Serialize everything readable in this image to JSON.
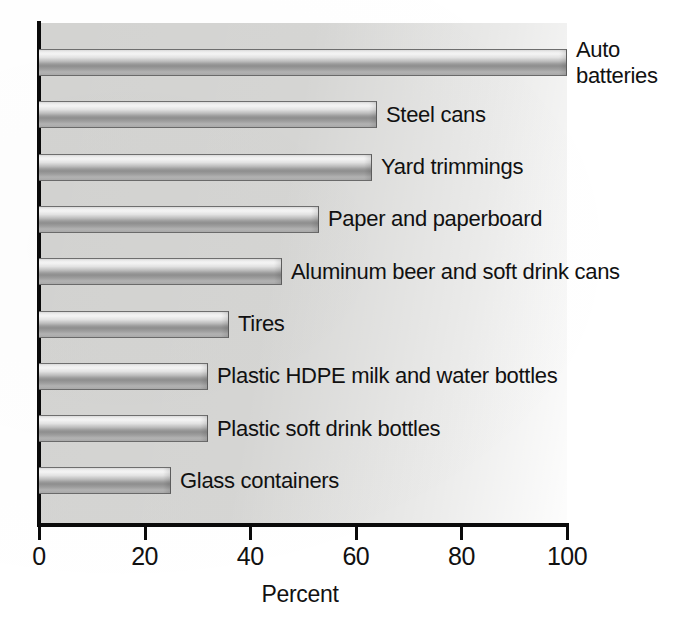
{
  "chart_data": {
    "type": "bar",
    "orientation": "horizontal",
    "title": "",
    "subtitle": "",
    "xlabel": "Percent",
    "ylabel": "",
    "xlim": [
      0,
      100
    ],
    "ylim": null,
    "grid": false,
    "legend": null,
    "xticks": [
      0,
      20,
      40,
      60,
      80,
      100
    ],
    "xticklabels": [
      "0",
      "20",
      "40",
      "60",
      "80",
      "100"
    ],
    "categories": [
      "Auto\nbatteries",
      "Steel cans",
      "Yard trimmings",
      "Paper and paperboard",
      "Aluminum beer and soft drink cans",
      "Tires",
      "Plastic HDPE milk and water bottles",
      "Plastic soft drink bottles",
      "Glass containers"
    ],
    "values": [
      100,
      64,
      63,
      53,
      46,
      36,
      32,
      32,
      25
    ],
    "bar_color": "#b0b0b0",
    "axis_color": "#0a0a0a",
    "plot_background_color": "#d4d4d2",
    "figure_background_color": "#ffffff"
  },
  "axis": {
    "x_title": "Percent",
    "ticks": [
      {
        "label": "0",
        "value": 0
      },
      {
        "label": "20",
        "value": 20
      },
      {
        "label": "40",
        "value": 40
      },
      {
        "label": "60",
        "value": 60
      },
      {
        "label": "80",
        "value": 80
      },
      {
        "label": "100",
        "value": 100
      }
    ]
  },
  "bars": [
    {
      "label": "Auto\nbatteries",
      "value": 100,
      "multiline": true
    },
    {
      "label": "Steel cans",
      "value": 64,
      "multiline": false
    },
    {
      "label": "Yard trimmings",
      "value": 63,
      "multiline": false
    },
    {
      "label": "Paper and paperboard",
      "value": 53,
      "multiline": false
    },
    {
      "label": "Aluminum beer and soft drink cans",
      "value": 46,
      "multiline": false
    },
    {
      "label": "Tires",
      "value": 36,
      "multiline": false
    },
    {
      "label": "Plastic HDPE milk and water bottles",
      "value": 32,
      "multiline": false
    },
    {
      "label": "Plastic soft drink bottles",
      "value": 32,
      "multiline": false
    },
    {
      "label": "Glass containers",
      "value": 25,
      "multiline": false
    }
  ]
}
